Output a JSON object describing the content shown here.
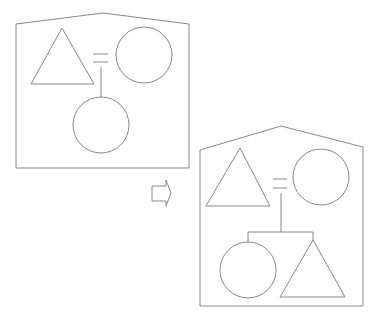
{
  "diagram": {
    "type": "genogram-household-transition",
    "stroke_color": "#888888",
    "background": "#ffffff",
    "before": {
      "house": "household-before",
      "members": [
        {
          "id": "father",
          "shape": "triangle",
          "role": "male"
        },
        {
          "id": "mother",
          "shape": "circle",
          "role": "female"
        },
        {
          "id": "child-1",
          "shape": "circle",
          "role": "female child"
        }
      ],
      "relationships": [
        {
          "type": "marriage",
          "symbol": "="
        },
        {
          "type": "descent",
          "from": "marriage",
          "to": [
            "child-1"
          ]
        }
      ]
    },
    "arrow": {
      "direction": "right",
      "icon": "outline-arrow"
    },
    "after": {
      "house": "household-after",
      "members": [
        {
          "id": "father",
          "shape": "triangle",
          "role": "male"
        },
        {
          "id": "mother",
          "shape": "circle",
          "role": "female"
        },
        {
          "id": "child-1",
          "shape": "circle",
          "role": "female child"
        },
        {
          "id": "child-2",
          "shape": "triangle",
          "role": "male child"
        }
      ],
      "relationships": [
        {
          "type": "marriage",
          "symbol": "="
        },
        {
          "type": "descent",
          "from": "marriage",
          "to": [
            "child-1",
            "child-2"
          ]
        }
      ]
    }
  }
}
